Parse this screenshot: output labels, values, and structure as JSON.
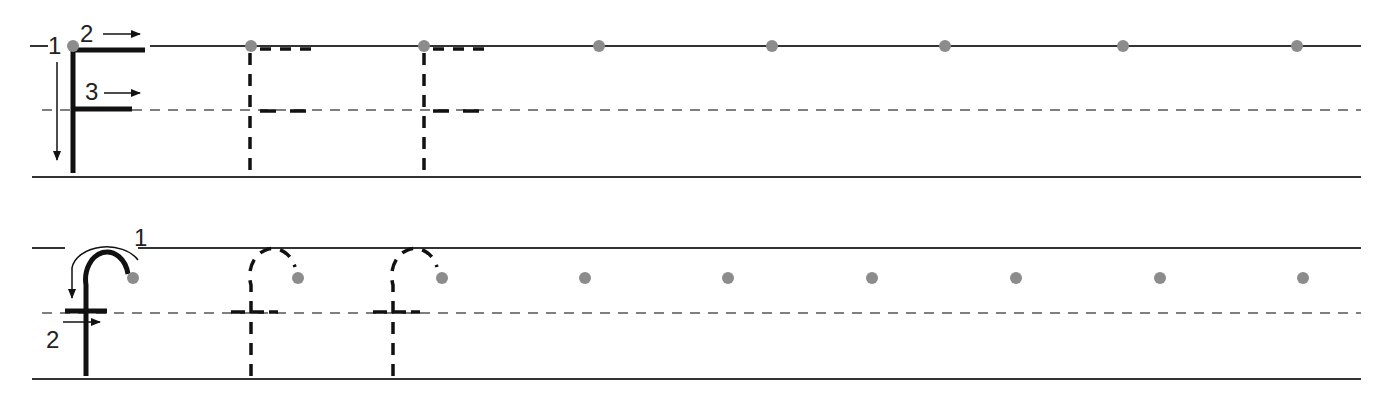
{
  "worksheet": {
    "colors": {
      "line": "#333333",
      "stroke": "#111111",
      "dot": "#8c8c8c",
      "dashed_guide": "#555555"
    },
    "rows": [
      {
        "letter": "F",
        "step_labels": [
          "1",
          "2",
          "3"
        ],
        "guide_lines": {
          "top_y": 46,
          "mid_y": 110,
          "bottom_y": 177
        },
        "trace_letter_x": [
          250,
          424
        ],
        "start_dot_x": [
          599,
          772,
          945,
          1123,
          1297
        ]
      },
      {
        "letter": "f",
        "step_labels": [
          "1",
          "2"
        ],
        "guide_lines": {
          "top_y": 248,
          "mid_y": 313,
          "bottom_y": 379
        },
        "trace_letter_x": [
          250,
          393
        ],
        "start_dot_x": [
          585,
          728,
          872,
          1016,
          1160,
          1303
        ]
      }
    ]
  }
}
